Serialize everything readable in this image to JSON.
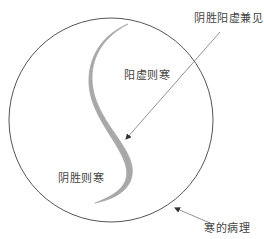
{
  "diagram": {
    "title": "",
    "labels": {
      "top_right": "阴胜阳虚兼见",
      "upper_region": "阳虚则寒",
      "lower_region": "阴胜则寒",
      "circle": "寒的病理"
    },
    "colors": {
      "circle_stroke": "#555555",
      "s_curve": "#a8a8a8",
      "leader_line": "#777777",
      "text": "#444444",
      "background": "#ffffff"
    }
  }
}
